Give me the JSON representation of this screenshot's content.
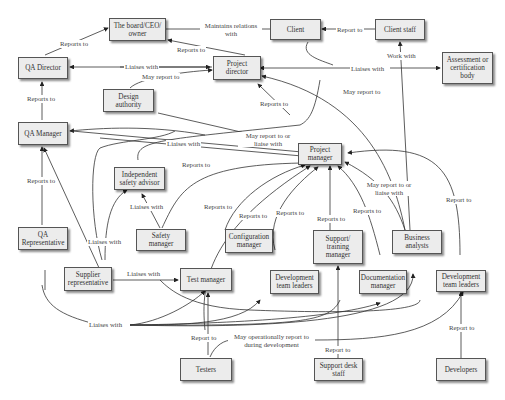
{
  "diagram": {
    "type": "organizational-relationship",
    "nodes": {
      "board": "The board/CEO/ owner",
      "client": "Client",
      "client_staff": "Client staff",
      "qa_director": "QA Director",
      "project_director": "Project director",
      "assessment_body": "Assessment or certification body",
      "design_authority": "Design authority",
      "qa_manager": "QA Manager",
      "project_manager": "Project manager",
      "safety_advisor": "Independent safety advisor",
      "safety_manager": "Safety manager",
      "qa_rep": "QA Representative",
      "config_manager": "Configuration manager",
      "support_manager": "Support/ training manager",
      "business_analysts": "Business analysts",
      "supplier_rep": "Supplier representative",
      "test_manager": "Test manager",
      "dev_leaders_1": "Development team leaders",
      "doc_manager": "Documentation manager",
      "dev_leaders_2": "Development team leaders",
      "testers": "Testers",
      "support_desk": "Support desk staff",
      "developers": "Developers"
    },
    "labels": {
      "maintains": "Maintains relations with",
      "report_to_client": "Report to",
      "reports_to_board_qa": "Reports to",
      "reports_to_board_pd": "Reports to",
      "liaises_qa_pd": "Liaises with",
      "may_report_to_da": "May report to",
      "work_with": "Work with",
      "liaises_assess": "Liaises with",
      "may_report_to_ba": "May report to",
      "reports_to_qa_mgr": "Reports to",
      "reports_to_pm_pd": "Reports to",
      "liaises_qam_pm": "Liaises with",
      "may_report_or_liaise_da": "May report to or liaise with",
      "reports_to_qarep": "Reports to",
      "liaises_safety": "Liaises with",
      "reports_to_sm": "Reports to",
      "liaises_supplier": "Liaises with",
      "reports_to_tm": "Reports to",
      "reports_to_cm": "Reports to",
      "reports_to_dtl": "Reports to",
      "reports_to_stm": "Reports to",
      "reports_to_doc": "Reports to",
      "may_report_or_liaise_ba": "May report to or liaise with",
      "report_to_dtl2": "Report to",
      "liaises_supplier_test": "Liaises with",
      "liaises_qarep_bottom": "Liaises with",
      "report_to_testers": "Report to",
      "may_operationally": "May operationally report to during development",
      "report_to_support_desk": "Report to",
      "report_to_developers": "Report to"
    }
  }
}
